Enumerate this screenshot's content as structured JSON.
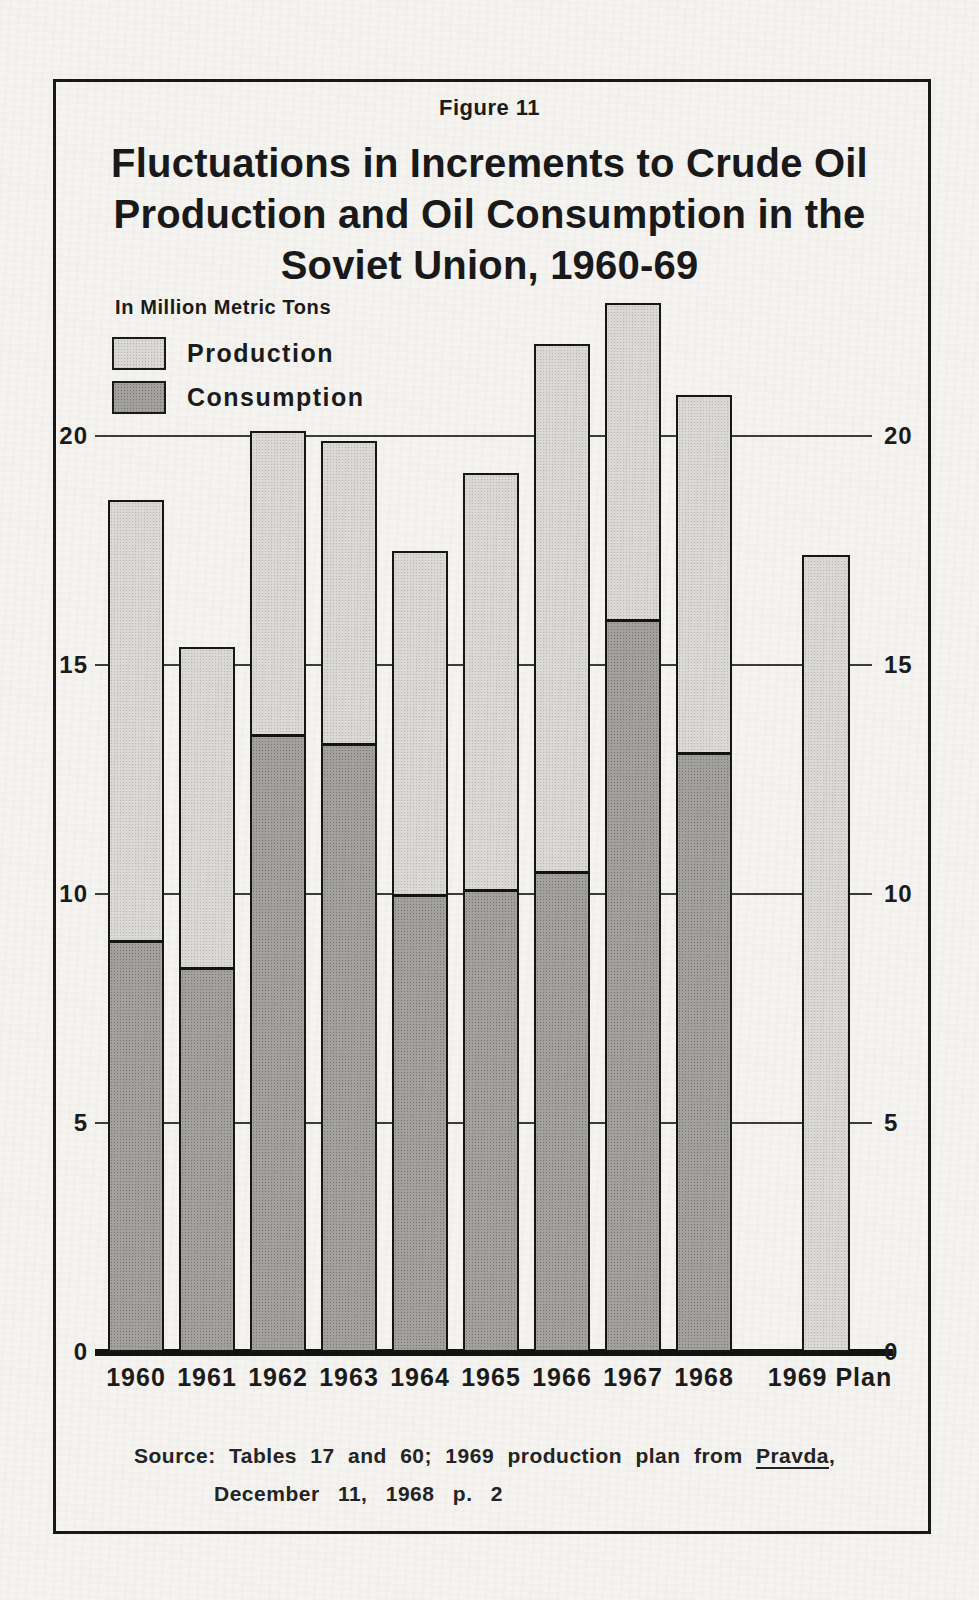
{
  "figure_label": "Figure 11",
  "title_lines": [
    "Fluctuations in Increments to Crude Oil",
    "Production and Oil Consumption in the",
    "Soviet Union, 1960-69"
  ],
  "legend": {
    "unit_label": "In Million Metric Tons",
    "items": [
      {
        "name": "production-swatch",
        "label": "Production",
        "color": "#dbdad6"
      },
      {
        "name": "consumption-swatch",
        "label": "Consumption",
        "color": "#a3a29e"
      }
    ]
  },
  "chart_data": {
    "type": "bar",
    "bar_style": "overlaid",
    "title": "Fluctuations in Increments to Crude Oil Production and Oil Consumption in the Soviet Union, 1960-69",
    "ylabel": "In Million Metric Tons",
    "categories": [
      "1960",
      "1961",
      "1962",
      "1963",
      "1964",
      "1965",
      "1966",
      "1967",
      "1968",
      "1969 Plan"
    ],
    "series": [
      {
        "name": "Production",
        "values": [
          18.6,
          15.4,
          20.1,
          19.9,
          17.5,
          19.2,
          22.0,
          22.9,
          20.9,
          17.4
        ]
      },
      {
        "name": "Consumption",
        "values": [
          9.0,
          8.4,
          13.5,
          13.3,
          10.0,
          10.1,
          10.5,
          16.0,
          13.1,
          null
        ]
      }
    ],
    "yticks": [
      0,
      5,
      10,
      15,
      20
    ],
    "ylim": [
      0,
      23
    ],
    "grid": true,
    "legend_position": "top-left"
  },
  "colors": {
    "paper": "#f4f3ef",
    "ink": "#1b1b1b",
    "production_fill": "#dbdad6",
    "consumption_fill": "#a3a29e",
    "bar_outline": "#161616"
  },
  "source": {
    "line1_before": "Source: Tables 17 and 60; 1969 production plan from",
    "pravda": "Pravda",
    "line1_after": ",",
    "line2": "December 11, 1968   p. 2"
  }
}
